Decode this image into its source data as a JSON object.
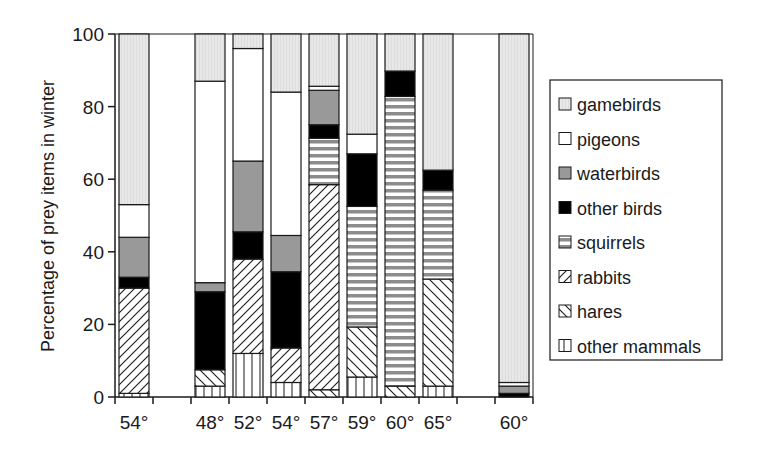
{
  "chart_data": {
    "type": "bar",
    "stacked": true,
    "title": "",
    "xlabel": "",
    "ylabel": "Percentage of prey items in winter",
    "ylim": [
      0,
      100
    ],
    "yticks": [
      0,
      20,
      40,
      60,
      80,
      100
    ],
    "grid": false,
    "legend_position": "right",
    "slots": [
      "54°",
      "",
      "48°",
      "52°",
      "54°",
      "57°",
      "59°",
      "60°",
      "65°",
      "",
      "60°"
    ],
    "categories": [
      "54°",
      "48°",
      "52°",
      "54°",
      "57°",
      "59°",
      "60°",
      "65°",
      "60°"
    ],
    "series": [
      {
        "name": "other mammals",
        "pattern": "vertical-lines",
        "values": [
          1,
          3,
          12,
          4,
          0,
          5.5,
          0,
          3,
          0
        ]
      },
      {
        "name": "hares",
        "pattern": "back-diagonal",
        "values": [
          0,
          4.5,
          0,
          0,
          2,
          13.8,
          3,
          29.5,
          0
        ]
      },
      {
        "name": "rabbits",
        "pattern": "forward-diagonal",
        "values": [
          29,
          0,
          26,
          9.5,
          56.5,
          0,
          0,
          0,
          0
        ]
      },
      {
        "name": "squirrels",
        "pattern": "horizontal-stripes",
        "values": [
          0,
          0,
          0,
          0,
          12.8,
          33.2,
          79.8,
          24.5,
          0
        ]
      },
      {
        "name": "other birds",
        "pattern": "solid-black",
        "values": [
          3,
          21.5,
          7.5,
          21,
          3.7,
          14.5,
          7,
          5.5,
          1
        ]
      },
      {
        "name": "waterbirds",
        "pattern": "solid-grey",
        "values": [
          11,
          2.5,
          19.5,
          10,
          9.5,
          0,
          0,
          0,
          2
        ]
      },
      {
        "name": "pigeons",
        "pattern": "white",
        "values": [
          9,
          55.5,
          31,
          39.5,
          1.1,
          5.4,
          0,
          0,
          1
        ]
      },
      {
        "name": "gamebirds",
        "pattern": "light-grey-dotted",
        "values": [
          47,
          13,
          4,
          16,
          14.4,
          27.6,
          10.2,
          37.5,
          96
        ]
      }
    ],
    "colors": {
      "gamebirds": "#e6e6e6",
      "pigeons": "#ffffff",
      "waterbirds": "#999999",
      "other_birds": "#000000",
      "squirrels_stripe": "#8c8c8c"
    }
  },
  "legend": {
    "items": [
      "gamebirds",
      "pigeons",
      "waterbirds",
      "other birds",
      "squirrels",
      "rabbits",
      "hares",
      "other mammals"
    ]
  }
}
